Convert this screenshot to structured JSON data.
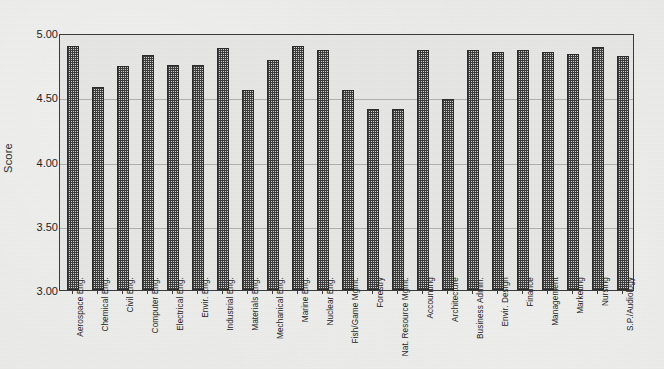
{
  "chart_data": {
    "type": "bar",
    "title": "",
    "xlabel": "",
    "ylabel": "Score",
    "ylim": [
      3.0,
      5.0
    ],
    "yticks": [
      "3.00",
      "3.50",
      "4.00",
      "4.50",
      "5.00"
    ],
    "ytick_values": [
      3.0,
      3.5,
      4.0,
      4.5,
      5.0
    ],
    "grid": true,
    "legend": "none",
    "categories": [
      "Aerospace Eng.",
      "Chemical Eng.",
      "Civil Eng.",
      "Computer Eng.",
      "Electrical Eng.",
      "Envir. Eng.",
      "Industrial Eng.",
      "Materials Eng.",
      "Mechanical Eng.",
      "Marine Eng.",
      "Nuclear Eng.",
      "Fish/Game Mgmt.",
      "Forestry",
      "Nat. Resource Mgmt.",
      "Accounting",
      "Architecture",
      "Business Admin.",
      "Envir. Design",
      "Finance",
      "Management",
      "Marketing",
      "Nursing",
      "S.P./Audiology"
    ],
    "values": [
      4.9,
      4.58,
      4.74,
      4.83,
      4.75,
      4.75,
      4.88,
      4.56,
      4.79,
      4.9,
      4.87,
      4.56,
      4.41,
      4.41,
      4.87,
      4.49,
      4.87,
      4.85,
      4.87,
      4.85,
      4.84,
      4.89,
      4.82
    ]
  },
  "style": {
    "bar_fill": "#3b3b3b",
    "bar_edge": "#2a2a2a",
    "axis_color": "#3a3a3a",
    "background": "#e9e9e7",
    "text_color": "#232323"
  }
}
